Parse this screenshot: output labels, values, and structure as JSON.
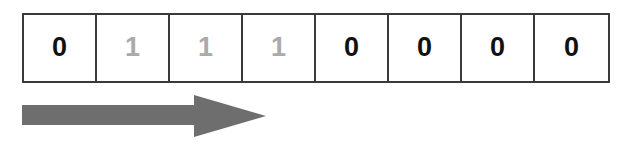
{
  "diagram": {
    "kind": "bit-row-with-direction-arrow",
    "background_color": "#ffffff",
    "border_color": "#3a3a3a",
    "cell_count": 8,
    "cells": [
      {
        "index": 0,
        "value": "0",
        "tone": "dark",
        "color": "#111111"
      },
      {
        "index": 1,
        "value": "1",
        "tone": "light",
        "color": "#aaaaaa"
      },
      {
        "index": 2,
        "value": "1",
        "tone": "light",
        "color": "#aaaaaa"
      },
      {
        "index": 3,
        "value": "1",
        "tone": "light",
        "color": "#aaaaaa"
      },
      {
        "index": 4,
        "value": "0",
        "tone": "dark",
        "color": "#111111"
      },
      {
        "index": 5,
        "value": "0",
        "tone": "dark",
        "color": "#111111"
      },
      {
        "index": 6,
        "value": "0",
        "tone": "dark",
        "color": "#111111"
      },
      {
        "index": 7,
        "value": "0",
        "tone": "dark",
        "color": "#111111"
      }
    ],
    "bit_string": "01110000",
    "arrow": {
      "icon": "arrow-right-icon",
      "direction": "right",
      "color": "#6e6e6e"
    }
  }
}
